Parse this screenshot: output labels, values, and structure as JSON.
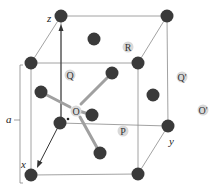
{
  "diagram": {
    "type": "crystal-unit-cell",
    "axes": {
      "x": "x",
      "y": "y",
      "z": "z"
    },
    "lattice_label": "a",
    "site_labels": [
      {
        "id": "Q",
        "text": "Q",
        "cx": 70,
        "cy": 75
      },
      {
        "id": "R",
        "text": "R",
        "cx": 128,
        "cy": 47
      },
      {
        "id": "Qp",
        "text": "Q'",
        "cx": 182,
        "cy": 77
      },
      {
        "id": "O",
        "text": "O",
        "cx": 76,
        "cy": 111
      },
      {
        "id": "P",
        "text": "P",
        "cx": 123,
        "cy": 131
      },
      {
        "id": "Op",
        "text": "O'",
        "cx": 203,
        "cy": 110
      }
    ],
    "colors": {
      "atom": "#3a3a3a",
      "site": "#d8d8d8",
      "edge": "#888888",
      "bond": "#9a9a9a"
    }
  }
}
